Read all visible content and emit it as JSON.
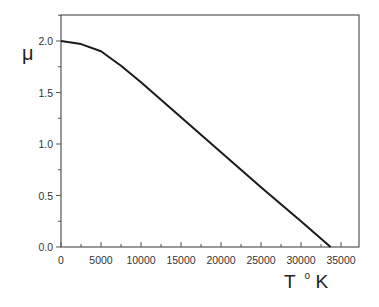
{
  "chart_data": {
    "type": "line",
    "title": "",
    "xlabel": "T °K",
    "ylabel": "μ",
    "xlim": [
      0,
      37500
    ],
    "ylim": [
      0.0,
      2.25
    ],
    "x_ticks": [
      0,
      5000,
      10000,
      15000,
      20000,
      25000,
      30000,
      35000
    ],
    "x_tick_labels": [
      "0",
      "5000",
      "10000",
      "15000",
      "20000",
      "25000",
      "30000",
      "35000"
    ],
    "y_ticks": [
      0.0,
      0.5,
      1.0,
      1.5,
      2.0
    ],
    "y_tick_labels": [
      "0.0",
      "0.5",
      "1.0",
      "1.5",
      "2.0"
    ],
    "grid": false,
    "legend": null,
    "series": [
      {
        "name": "mu",
        "color": "#1a1a1a",
        "x": [
          0,
          2500,
          5000,
          7500,
          10000,
          15000,
          20000,
          25000,
          30000,
          33700
        ],
        "y": [
          2.0,
          1.97,
          1.9,
          1.76,
          1.6,
          1.26,
          0.92,
          0.58,
          0.25,
          0.0
        ]
      }
    ]
  },
  "labels": {
    "ylabel": "μ",
    "xlabel_T": "T",
    "xlabel_deg": "o",
    "xlabel_K": "K"
  }
}
